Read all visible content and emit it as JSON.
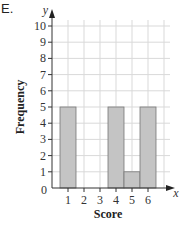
{
  "question_label": "E.",
  "chart_data": {
    "type": "bar",
    "title": "",
    "xlabel": "Score",
    "ylabel": "Frequency",
    "x_axis_var": "x",
    "y_axis_var": "y",
    "origin_label": "0",
    "categories": [
      "1",
      "2",
      "3",
      "4",
      "5",
      "6"
    ],
    "values": [
      5,
      0,
      0,
      5,
      1,
      5
    ],
    "yticks": [
      1,
      2,
      3,
      4,
      5,
      6,
      7,
      8,
      9,
      10
    ],
    "xticks": [
      1,
      2,
      3,
      4,
      5,
      6
    ],
    "ylim": [
      0,
      10
    ],
    "xlim": [
      0,
      7
    ],
    "grid": true,
    "legend": null,
    "bar_color": "#c4c4c4",
    "bar_edge_color": "#777777",
    "grid_color": "#d9d9d9"
  }
}
